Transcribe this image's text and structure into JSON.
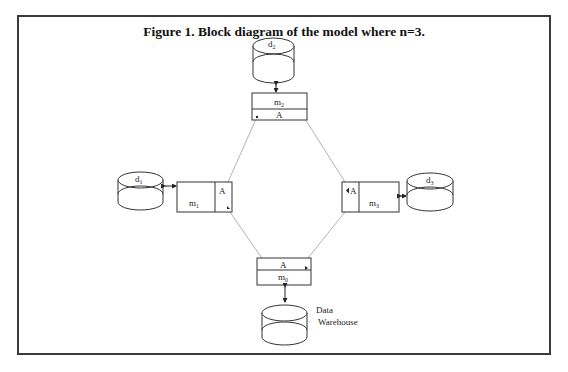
{
  "figure": {
    "title": "Figure 1. Block diagram of the model where n=3."
  },
  "databases": {
    "d1": {
      "label": "d",
      "sub": "1"
    },
    "d2": {
      "label": "d",
      "sub": "2"
    },
    "d3": {
      "label": "d",
      "sub": "3"
    },
    "warehouse": {
      "line1": "Data",
      "line2": "Warehouse"
    }
  },
  "modules": {
    "m0": {
      "label": "m",
      "sub": "0",
      "agent": "A"
    },
    "m1": {
      "label": "m",
      "sub": "1",
      "agent": "A"
    },
    "m2": {
      "label": "m",
      "sub": "2",
      "agent": "A"
    },
    "m3": {
      "label": "m",
      "sub": "3",
      "agent": "A"
    }
  },
  "colors": {
    "line": "#333333",
    "connector": "#9a9a9a",
    "border": "#3a3a3a"
  }
}
